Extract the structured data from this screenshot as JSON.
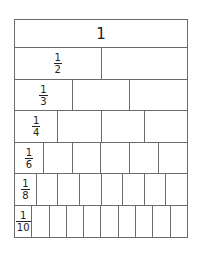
{
  "colors": {
    "line": "#6b6b6b",
    "text": "#222222",
    "background": "#ffffff"
  },
  "rows": [
    {
      "label": "1",
      "numerator": "",
      "denominator": "",
      "parts": 1,
      "height": 27
    },
    {
      "label": "1/2",
      "numerator": "1",
      "denominator": "2",
      "parts": 2,
      "height": 32
    },
    {
      "label": "1/3",
      "numerator": "1",
      "denominator": "3",
      "parts": 3,
      "height": 31
    },
    {
      "label": "1/4",
      "numerator": "1",
      "denominator": "4",
      "parts": 4,
      "height": 32
    },
    {
      "label": "1/6",
      "numerator": "1",
      "denominator": "6",
      "parts": 6,
      "height": 31
    },
    {
      "label": "1/8",
      "numerator": "1",
      "denominator": "8",
      "parts": 8,
      "height": 32
    },
    {
      "label": "1/10",
      "numerator": "1",
      "denominator": "10",
      "parts": 10,
      "height": 32
    }
  ]
}
